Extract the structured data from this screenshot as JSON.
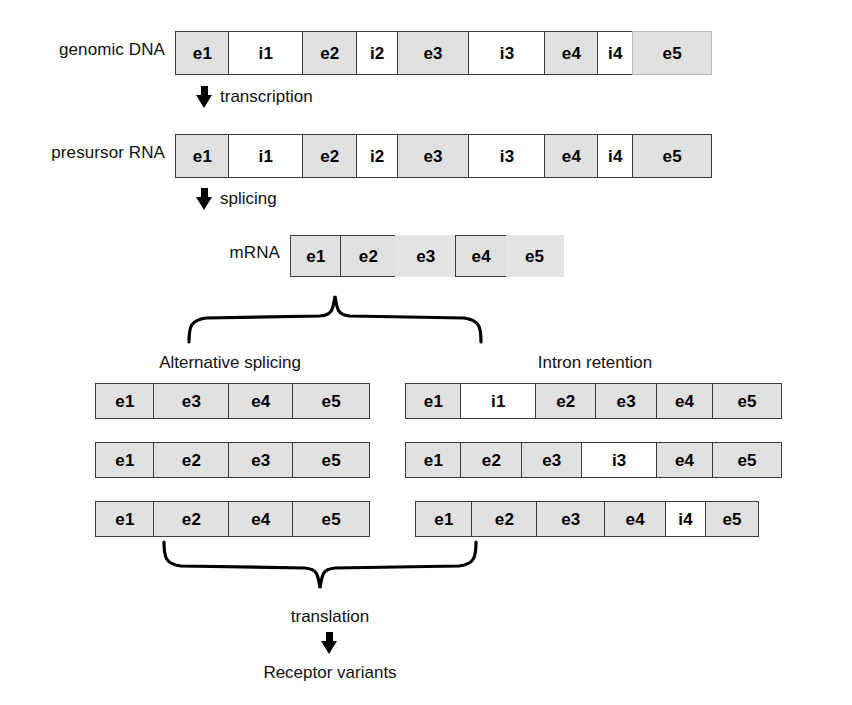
{
  "rows": {
    "genomic": {
      "label": "genomic DNA",
      "segments": [
        {
          "text": "e1",
          "kind": "exon",
          "width": 55
        },
        {
          "text": "i1",
          "kind": "intron",
          "width": 75
        },
        {
          "text": "e2",
          "kind": "exon",
          "width": 56
        },
        {
          "text": "i2",
          "kind": "intron",
          "width": 42
        },
        {
          "text": "e3",
          "kind": "exon",
          "width": 73
        },
        {
          "text": "i3",
          "kind": "intron",
          "width": 78
        },
        {
          "text": "e4",
          "kind": "exon",
          "width": 54
        },
        {
          "text": "i4",
          "kind": "intron",
          "width": 37
        },
        {
          "text": "e5",
          "kind": "faint",
          "width": 80
        }
      ]
    },
    "precursor": {
      "label": "presursor RNA",
      "segments": [
        {
          "text": "e1",
          "kind": "exon",
          "width": 55
        },
        {
          "text": "i1",
          "kind": "intron",
          "width": 75
        },
        {
          "text": "e2",
          "kind": "exon",
          "width": 56
        },
        {
          "text": "i2",
          "kind": "intron",
          "width": 42
        },
        {
          "text": "e3",
          "kind": "exon",
          "width": 73
        },
        {
          "text": "i3",
          "kind": "intron",
          "width": 78
        },
        {
          "text": "e4",
          "kind": "exon",
          "width": 54
        },
        {
          "text": "i4",
          "kind": "intron",
          "width": 37
        },
        {
          "text": "e5",
          "kind": "exon",
          "width": 80
        }
      ]
    },
    "mrna": {
      "label": "mRNA",
      "segments": [
        {
          "text": "e1",
          "kind": "exon",
          "width": 52
        },
        {
          "text": "e2",
          "kind": "exon",
          "width": 56
        },
        {
          "text": "e3",
          "kind": "soft",
          "width": 62
        },
        {
          "text": "e4",
          "kind": "exon",
          "width": 52
        },
        {
          "text": "e5",
          "kind": "soft",
          "width": 58
        }
      ]
    }
  },
  "steps": {
    "transcription": "transcription",
    "splicing": "splicing",
    "translation": "translation"
  },
  "sections": {
    "alternative_splicing": {
      "heading": "Alternative splicing",
      "variants": [
        {
          "segments": [
            {
              "text": "e1",
              "kind": "exon",
              "width": 60
            },
            {
              "text": "e3",
              "kind": "exon",
              "width": 76
            },
            {
              "text": "e4",
              "kind": "exon",
              "width": 66
            },
            {
              "text": "e5",
              "kind": "exon",
              "width": 78
            }
          ]
        },
        {
          "segments": [
            {
              "text": "e1",
              "kind": "exon",
              "width": 60
            },
            {
              "text": "e2",
              "kind": "exon",
              "width": 76
            },
            {
              "text": "e3",
              "kind": "exon",
              "width": 66
            },
            {
              "text": "e5",
              "kind": "exon",
              "width": 78
            }
          ]
        },
        {
          "segments": [
            {
              "text": "e1",
              "kind": "exon",
              "width": 60
            },
            {
              "text": "e2",
              "kind": "exon",
              "width": 76
            },
            {
              "text": "e4",
              "kind": "exon",
              "width": 66
            },
            {
              "text": "e5",
              "kind": "exon",
              "width": 78
            }
          ]
        }
      ]
    },
    "intron_retention": {
      "heading": "Intron retention",
      "variants": [
        {
          "segments": [
            {
              "text": "e1",
              "kind": "exon",
              "width": 57
            },
            {
              "text": "i1",
              "kind": "intron",
              "width": 76
            },
            {
              "text": "e2",
              "kind": "exon",
              "width": 62
            },
            {
              "text": "e3",
              "kind": "exon",
              "width": 62
            },
            {
              "text": "e4",
              "kind": "exon",
              "width": 58
            },
            {
              "text": "e5",
              "kind": "exon",
              "width": 70
            }
          ]
        },
        {
          "segments": [
            {
              "text": "e1",
              "kind": "exon",
              "width": 57
            },
            {
              "text": "e2",
              "kind": "exon",
              "width": 62
            },
            {
              "text": "e3",
              "kind": "exon",
              "width": 62
            },
            {
              "text": "i3",
              "kind": "intron",
              "width": 76
            },
            {
              "text": "e4",
              "kind": "exon",
              "width": 58
            },
            {
              "text": "e5",
              "kind": "exon",
              "width": 70
            }
          ]
        },
        {
          "segments": [
            {
              "text": "e1",
              "kind": "exon",
              "width": 58
            },
            {
              "text": "e2",
              "kind": "exon",
              "width": 66
            },
            {
              "text": "e3",
              "kind": "exon",
              "width": 70
            },
            {
              "text": "e4",
              "kind": "exon",
              "width": 62
            },
            {
              "text": "i4",
              "kind": "intron",
              "width": 42
            },
            {
              "text": "e5",
              "kind": "exon",
              "width": 54
            }
          ]
        }
      ]
    }
  },
  "output": {
    "label": "Receptor variants"
  },
  "colors": {
    "exon_fill": "#e0e0e0",
    "intron_fill": "#ffffff",
    "stroke": "#3a3a3a",
    "text": "#111111",
    "background": "#ffffff"
  }
}
